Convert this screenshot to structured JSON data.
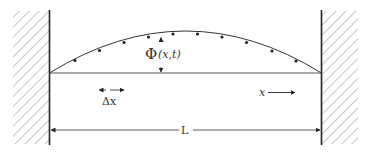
{
  "diagram": {
    "labels": {
      "field": "Φ(x,t)",
      "field_symbol": "Φ",
      "field_args": "(x,t)",
      "delta_x": "Δx",
      "x_direction": "x",
      "length": "L"
    },
    "walls": [
      "left-wall",
      "right-wall"
    ],
    "point_count": 10,
    "colors": {
      "ink": "#222222",
      "hatch": "#888888",
      "background": "#ffffff"
    }
  }
}
